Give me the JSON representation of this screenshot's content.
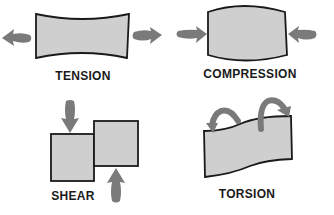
{
  "diagram": {
    "panels": [
      {
        "id": "tension",
        "label": "TENSION"
      },
      {
        "id": "compression",
        "label": "COMPRESSION"
      },
      {
        "id": "shear",
        "label": "SHEAR"
      },
      {
        "id": "torsion",
        "label": "TORSION"
      }
    ],
    "colors": {
      "fill": "#cfcfcf",
      "outline": "#1a1a1a",
      "arrow": "#7a7a7a",
      "background": "#ffffff"
    }
  }
}
